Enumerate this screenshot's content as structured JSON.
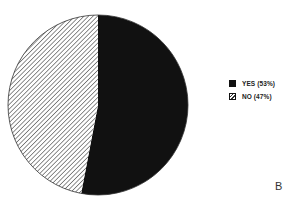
{
  "chart_data": {
    "type": "pie",
    "title": "",
    "categories": [
      "YES",
      "NO"
    ],
    "values": [
      53,
      47
    ],
    "labels": [
      "YES (53%)",
      "NO (47%)"
    ],
    "series": [
      {
        "name": "YES",
        "value": 53,
        "fill": "solid",
        "color": "#111111"
      },
      {
        "name": "NO",
        "value": 47,
        "fill": "hatched",
        "color": "#ffffff"
      }
    ],
    "start_angle_deg": 0,
    "direction": "clockwise",
    "legend_position": "right"
  },
  "legend": {
    "items": [
      {
        "label": "YES (53%)",
        "style": "solid"
      },
      {
        "label": "NO (47%)",
        "style": "hatched"
      }
    ]
  },
  "panel_label": "B",
  "colors": {
    "solid": "#111111",
    "hatch_line": "#444444",
    "outline": "#333333"
  }
}
